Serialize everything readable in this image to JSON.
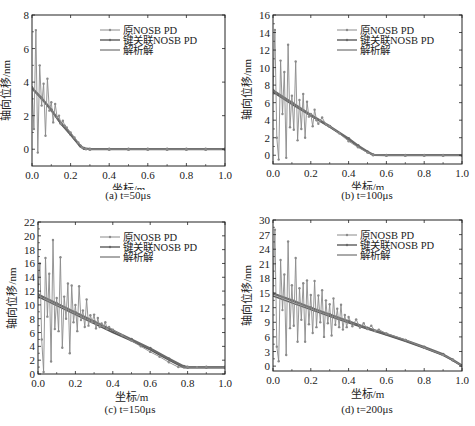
{
  "legend": {
    "entries": [
      "原NOSB PD",
      "键关联NOSB PD",
      "解析解"
    ]
  },
  "axes": {
    "xlabel": "坐标/m",
    "ylabel": "轴向位移/nm"
  },
  "colors": {
    "original": "#8a8a8a",
    "bond": "#6a6a6a",
    "analytic": "#555555",
    "axis": "#222222"
  },
  "captions": {
    "a": "(a) t=50μs",
    "b": "(b) t=100μs",
    "c": "(c) t=150μs",
    "d": "(d) t=200μs"
  },
  "chart_data": [
    {
      "id": "a",
      "type": "line",
      "title": "(a) t=50μs",
      "xlabel": "坐标/m",
      "ylabel": "轴向位移/nm",
      "xlim": [
        0,
        1.0
      ],
      "ylim": [
        -1,
        8
      ],
      "xticks": [
        0.0,
        0.2,
        0.4,
        0.6,
        0.8,
        1.0
      ],
      "xtick_labels": [
        "0.0",
        "0.2",
        "0.4",
        "0.6",
        "0.8",
        "1.0"
      ],
      "yticks": [
        0,
        2,
        4,
        6,
        8
      ],
      "ytick_labels": [
        "0",
        "2",
        "4",
        "6",
        "8"
      ],
      "legend_position": "upper right",
      "grid": false,
      "series": [
        {
          "name": "原NOSB PD",
          "x": [
            0.0,
            0.01,
            0.02,
            0.03,
            0.04,
            0.05,
            0.06,
            0.07,
            0.08,
            0.09,
            0.1,
            0.11,
            0.12,
            0.13,
            0.14,
            0.15,
            0.16,
            0.17,
            0.18,
            0.2,
            0.22,
            0.24,
            0.26,
            0.28,
            0.3,
            0.4,
            0.5,
            0.6,
            0.7,
            0.8,
            0.9,
            1.0
          ],
          "y": [
            3.7,
            1.2,
            7.1,
            -0.2,
            5.0,
            2.6,
            3.9,
            0.8,
            4.2,
            2.3,
            2.8,
            1.6,
            2.7,
            1.9,
            2.0,
            1.5,
            1.7,
            1.4,
            1.3,
            1.0,
            0.7,
            0.4,
            0.1,
            0.0,
            0.0,
            0.0,
            0.0,
            0.0,
            0.0,
            0.0,
            0.0,
            0.0
          ]
        },
        {
          "name": "键关联NOSB PD",
          "x": [
            0.0,
            0.05,
            0.1,
            0.15,
            0.2,
            0.25,
            0.27,
            0.3,
            0.4,
            0.5,
            0.6,
            0.7,
            0.8,
            0.9,
            1.0
          ],
          "y": [
            3.65,
            3.05,
            2.35,
            1.55,
            0.9,
            0.2,
            0.05,
            0.0,
            0.0,
            0.0,
            0.0,
            0.0,
            0.0,
            0.0,
            0.0
          ]
        },
        {
          "name": "解析解",
          "x": [
            0.0,
            0.05,
            0.1,
            0.15,
            0.2,
            0.25,
            0.27,
            0.3,
            0.4,
            0.5,
            0.6,
            0.7,
            0.8,
            0.9,
            1.0
          ],
          "y": [
            3.6,
            3.0,
            2.3,
            1.5,
            0.85,
            0.15,
            0.0,
            0.0,
            0.0,
            0.0,
            0.0,
            0.0,
            0.0,
            0.0,
            0.0
          ]
        }
      ]
    },
    {
      "id": "b",
      "type": "line",
      "title": "(b) t=100μs",
      "xlabel": "坐标/m",
      "ylabel": "轴向位移/nm",
      "xlim": [
        0,
        1.0
      ],
      "ylim": [
        -1,
        16
      ],
      "xticks": [
        0.0,
        0.2,
        0.4,
        0.6,
        0.8,
        1.0
      ],
      "xtick_labels": [
        "0.0",
        "0.2",
        "0.4",
        "0.6",
        "0.8",
        "1.0"
      ],
      "yticks": [
        0,
        2,
        4,
        6,
        8,
        10,
        12,
        14,
        16
      ],
      "ytick_labels": [
        "0",
        "2",
        "4",
        "6",
        "8",
        "10",
        "12",
        "14",
        "16"
      ],
      "legend_position": "upper right",
      "grid": false,
      "series": [
        {
          "name": "原NOSB PD",
          "x": [
            0.0,
            0.01,
            0.02,
            0.03,
            0.04,
            0.05,
            0.06,
            0.07,
            0.08,
            0.09,
            0.1,
            0.11,
            0.12,
            0.13,
            0.14,
            0.15,
            0.16,
            0.17,
            0.18,
            0.19,
            0.2,
            0.21,
            0.22,
            0.23,
            0.24,
            0.25,
            0.26,
            0.28,
            0.3,
            0.35,
            0.4,
            0.45,
            0.5,
            0.53,
            0.6,
            0.7,
            0.8,
            0.9,
            1.0
          ],
          "y": [
            7.3,
            14.3,
            2.0,
            -0.5,
            10.8,
            4.7,
            9.5,
            -0.3,
            12.6,
            3.2,
            6.8,
            2.9,
            10.7,
            1.7,
            6.3,
            3.0,
            7.0,
            2.0,
            6.1,
            4.4,
            4.7,
            3.3,
            5.2,
            4.0,
            3.6,
            4.0,
            4.3,
            3.5,
            3.3,
            2.5,
            1.6,
            0.9,
            0.3,
            0.05,
            0.0,
            0.0,
            0.0,
            0.0,
            0.0
          ]
        },
        {
          "name": "键关联NOSB PD",
          "x": [
            0.0,
            0.1,
            0.2,
            0.3,
            0.4,
            0.45,
            0.5,
            0.53,
            0.6,
            0.7,
            0.8,
            0.9,
            1.0
          ],
          "y": [
            7.4,
            6.0,
            4.6,
            3.3,
            1.9,
            1.1,
            0.4,
            0.05,
            0.0,
            0.0,
            0.0,
            0.0,
            0.0
          ]
        },
        {
          "name": "解析解",
          "x": [
            0.0,
            0.1,
            0.2,
            0.3,
            0.4,
            0.45,
            0.5,
            0.53,
            0.6,
            0.7,
            0.8,
            0.9,
            1.0
          ],
          "y": [
            7.2,
            5.8,
            4.5,
            3.2,
            1.8,
            1.0,
            0.35,
            0.0,
            0.0,
            0.0,
            0.0,
            0.0,
            0.0
          ]
        }
      ]
    },
    {
      "id": "c",
      "type": "line",
      "title": "(c) t=150μs",
      "xlabel": "坐标/m",
      "ylabel": "轴向位移/nm",
      "xlim": [
        0,
        1.0
      ],
      "ylim": [
        0,
        22
      ],
      "xticks": [
        0.0,
        0.2,
        0.4,
        0.6,
        0.8,
        1.0
      ],
      "xtick_labels": [
        "0.0",
        "0.2",
        "0.4",
        "0.6",
        "0.8",
        "1.0"
      ],
      "yticks": [
        0,
        2,
        4,
        6,
        8,
        10,
        12,
        14,
        16,
        18,
        20,
        22
      ],
      "ytick_labels": [
        "0",
        "2",
        "4",
        "6",
        "8",
        "10",
        "12",
        "14",
        "16",
        "18",
        "20",
        "22"
      ],
      "legend_position": "upper right",
      "grid": false,
      "series": [
        {
          "name": "原NOSB PD",
          "x": [
            0.0,
            0.01,
            0.02,
            0.03,
            0.04,
            0.05,
            0.06,
            0.07,
            0.08,
            0.09,
            0.1,
            0.11,
            0.12,
            0.13,
            0.14,
            0.15,
            0.16,
            0.17,
            0.18,
            0.19,
            0.2,
            0.21,
            0.22,
            0.23,
            0.24,
            0.25,
            0.26,
            0.27,
            0.28,
            0.29,
            0.3,
            0.31,
            0.32,
            0.33,
            0.34,
            0.35,
            0.36,
            0.37,
            0.38,
            0.4,
            0.45,
            0.5,
            0.55,
            0.6,
            0.65,
            0.7,
            0.75,
            0.8,
            0.85,
            0.9,
            1.0
          ],
          "y": [
            11.5,
            16.0,
            5.0,
            0.3,
            16.8,
            8.3,
            14.5,
            1.8,
            19.4,
            6.5,
            11.0,
            6.2,
            16.9,
            3.8,
            11.2,
            8.0,
            13.1,
            3.0,
            12.8,
            7.5,
            10.0,
            6.2,
            12.7,
            7.8,
            9.2,
            6.8,
            10.8,
            7.0,
            8.5,
            7.5,
            8.6,
            6.6,
            8.1,
            6.8,
            7.3,
            6.9,
            7.5,
            6.5,
            6.8,
            6.4,
            5.6,
            4.8,
            4.0,
            3.2,
            2.5,
            1.7,
            1.0,
            1.0,
            1.0,
            1.0,
            1.0
          ]
        },
        {
          "name": "键关联NOSB PD",
          "x": [
            0.0,
            0.1,
            0.2,
            0.3,
            0.4,
            0.5,
            0.6,
            0.7,
            0.78,
            0.8,
            0.9,
            1.0
          ],
          "y": [
            11.5,
            10.2,
            8.9,
            7.6,
            6.3,
            5.0,
            3.7,
            2.2,
            1.1,
            1.0,
            1.0,
            1.0
          ]
        },
        {
          "name": "解析解",
          "x": [
            0.0,
            0.1,
            0.2,
            0.3,
            0.4,
            0.5,
            0.6,
            0.7,
            0.78,
            0.8,
            0.9,
            1.0
          ],
          "y": [
            11.2,
            9.9,
            8.6,
            7.3,
            6.0,
            4.8,
            3.5,
            2.0,
            0.9,
            0.9,
            0.9,
            0.9
          ]
        }
      ]
    },
    {
      "id": "d",
      "type": "line",
      "title": "(d) t=200μs",
      "xlabel": "坐标/m",
      "ylabel": "轴向位移/nm",
      "xlim": [
        0,
        1.0
      ],
      "ylim": [
        -1,
        30
      ],
      "xticks": [
        0.0,
        0.2,
        0.4,
        0.6,
        0.8,
        1.0
      ],
      "xtick_labels": [
        "0.0",
        "0.2",
        "0.4",
        "0.6",
        "0.8",
        "1.0"
      ],
      "yticks": [
        0,
        3,
        6,
        9,
        12,
        15,
        18,
        21,
        24,
        27,
        30
      ],
      "ytick_labels": [
        "0",
        "3",
        "6",
        "9",
        "12",
        "15",
        "18",
        "21",
        "24",
        "27",
        "30"
      ],
      "legend_position": "upper right",
      "grid": false,
      "series": [
        {
          "name": "原NOSB PD",
          "x": [
            0.0,
            0.01,
            0.02,
            0.03,
            0.04,
            0.05,
            0.06,
            0.07,
            0.08,
            0.09,
            0.1,
            0.11,
            0.12,
            0.13,
            0.14,
            0.15,
            0.16,
            0.17,
            0.18,
            0.19,
            0.2,
            0.21,
            0.22,
            0.23,
            0.24,
            0.25,
            0.26,
            0.27,
            0.28,
            0.29,
            0.3,
            0.31,
            0.32,
            0.33,
            0.34,
            0.35,
            0.36,
            0.37,
            0.38,
            0.39,
            0.4,
            0.42,
            0.44,
            0.46,
            0.48,
            0.5,
            0.52,
            0.54,
            0.56,
            0.6,
            0.7,
            0.8,
            0.9,
            0.95,
            1.0
          ],
          "y": [
            15.0,
            28.0,
            4.0,
            1.0,
            21.8,
            11.5,
            18.8,
            2.3,
            25.6,
            7.8,
            16.6,
            8.3,
            22.2,
            5.0,
            16.0,
            9.5,
            17.0,
            5.0,
            17.6,
            8.6,
            14.6,
            6.8,
            17.5,
            8.0,
            14.5,
            9.0,
            15.6,
            6.0,
            13.5,
            8.8,
            12.7,
            6.3,
            13.9,
            8.5,
            11.8,
            8.0,
            12.6,
            7.5,
            10.5,
            8.0,
            10.1,
            8.2,
            9.6,
            7.9,
            8.8,
            7.6,
            8.3,
            7.2,
            7.5,
            6.7,
            5.4,
            3.8,
            2.3,
            1.3,
            0.0
          ]
        },
        {
          "name": "键关联NOSB PD",
          "x": [
            0.0,
            0.1,
            0.2,
            0.3,
            0.4,
            0.5,
            0.6,
            0.7,
            0.8,
            0.9,
            0.95,
            1.0
          ],
          "y": [
            14.9,
            13.5,
            12.0,
            10.6,
            9.2,
            7.8,
            6.6,
            5.3,
            3.9,
            2.4,
            1.3,
            0.1
          ]
        },
        {
          "name": "解析解",
          "x": [
            0.0,
            0.1,
            0.2,
            0.3,
            0.4,
            0.5,
            0.6,
            0.7,
            0.8,
            0.9,
            0.95,
            1.0
          ],
          "y": [
            14.4,
            13.0,
            11.6,
            10.2,
            8.9,
            7.6,
            6.4,
            5.1,
            3.7,
            2.2,
            1.2,
            0.0
          ]
        }
      ]
    }
  ]
}
